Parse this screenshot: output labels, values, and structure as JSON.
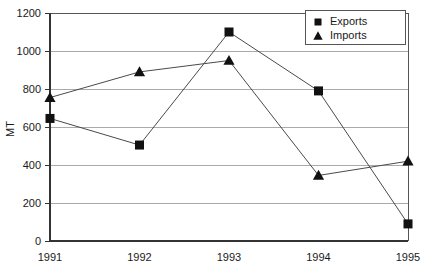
{
  "chart_data": {
    "type": "line",
    "title": "",
    "xlabel": "",
    "ylabel": "MT",
    "categories": [
      "1991",
      "1992",
      "1993",
      "1994",
      "1995"
    ],
    "series": [
      {
        "name": "Exports",
        "marker": "square",
        "values": [
          645,
          505,
          1100,
          790,
          90
        ]
      },
      {
        "name": "Imports",
        "marker": "triangle",
        "values": [
          755,
          890,
          950,
          345,
          420
        ]
      }
    ],
    "ylim": [
      0,
      1200
    ],
    "ytick_labels": [
      "1200",
      "1000",
      "800",
      "600",
      "400",
      "200",
      "0"
    ],
    "ytick_values": [
      1200,
      1000,
      800,
      600,
      400,
      200,
      0
    ],
    "grid": true,
    "legend_position": "top-right",
    "colors": {
      "marker": "#111111",
      "line": "#4a4a4a",
      "grid": "#aaaaaa",
      "axis": "#333333",
      "background": "#ffffff"
    }
  },
  "legend": {
    "entries": [
      {
        "label": "Exports",
        "glyph": "square-marker-icon"
      },
      {
        "label": "Imports",
        "glyph": "triangle-marker-icon"
      }
    ]
  },
  "axes": {
    "y_title": "MT",
    "y_ticks": [
      "1200",
      "1000",
      "800",
      "600",
      "400",
      "200",
      "0"
    ],
    "x_ticks": [
      "1991",
      "1992",
      "1993",
      "1994",
      "1995"
    ]
  }
}
